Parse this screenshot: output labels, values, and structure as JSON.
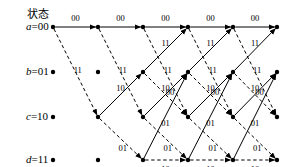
{
  "diagram": {
    "type": "convolutional-code-trellis",
    "title": "状态",
    "states": [
      {
        "id": "a",
        "name": "a",
        "eq": "=",
        "value": "00",
        "row": 0,
        "y": 27
      },
      {
        "id": "b",
        "name": "b",
        "eq": "=",
        "value": "01",
        "row": 1,
        "y": 72
      },
      {
        "id": "c",
        "name": "c",
        "eq": "=",
        "value": "10",
        "row": 2,
        "y": 117
      },
      {
        "id": "d",
        "name": "d",
        "eq": "=",
        "value": "11",
        "row": 3,
        "y": 160
      }
    ],
    "columns": [
      53,
      98,
      143,
      188,
      233,
      277
    ],
    "stage_count": 5,
    "colors": {
      "line": "#000000",
      "node": "#000000",
      "text": "#000000"
    },
    "legend": {
      "solid": "input 0",
      "dashed": "input 1"
    },
    "nodes": [
      {
        "col": 0,
        "row": 0
      },
      {
        "col": 0,
        "row": 1
      },
      {
        "col": 0,
        "row": 2
      },
      {
        "col": 0,
        "row": 3
      },
      {
        "col": 1,
        "row": 0
      },
      {
        "col": 1,
        "row": 1
      },
      {
        "col": 1,
        "row": 2
      },
      {
        "col": 1,
        "row": 3
      },
      {
        "col": 2,
        "row": 0
      },
      {
        "col": 2,
        "row": 1
      },
      {
        "col": 2,
        "row": 2
      },
      {
        "col": 2,
        "row": 3
      },
      {
        "col": 3,
        "row": 0
      },
      {
        "col": 3,
        "row": 1
      },
      {
        "col": 3,
        "row": 2
      },
      {
        "col": 3,
        "row": 3
      },
      {
        "col": 4,
        "row": 0
      },
      {
        "col": 4,
        "row": 1
      },
      {
        "col": 4,
        "row": 2
      },
      {
        "col": 4,
        "row": 3
      },
      {
        "col": 5,
        "row": 0
      },
      {
        "col": 5,
        "row": 1
      },
      {
        "col": 5,
        "row": 2
      },
      {
        "col": 5,
        "row": 3
      }
    ],
    "edges": [
      {
        "col": 0,
        "from": 0,
        "to": 0,
        "style": "solid",
        "label": "00",
        "lx": 0.5,
        "ly": -9
      },
      {
        "col": 0,
        "from": 0,
        "to": 2,
        "style": "dashed",
        "label": "11",
        "lx": 0.55,
        "ly": -7
      },
      {
        "col": 1,
        "from": 0,
        "to": 0,
        "style": "solid",
        "label": "00",
        "lx": 0.5,
        "ly": -9
      },
      {
        "col": 1,
        "from": 0,
        "to": 2,
        "style": "dashed",
        "label": "11",
        "lx": 0.55,
        "ly": -7
      },
      {
        "col": 1,
        "from": 2,
        "to": 1,
        "style": "solid",
        "label": "10",
        "lx": 0.5,
        "ly": -7
      },
      {
        "col": 1,
        "from": 2,
        "to": 3,
        "style": "dashed",
        "label": "01",
        "lx": 0.55,
        "ly": 7
      },
      {
        "col": 2,
        "from": 0,
        "to": 0,
        "style": "solid",
        "label": "00",
        "lx": 0.5,
        "ly": -9
      },
      {
        "col": 2,
        "from": 0,
        "to": 2,
        "style": "dashed",
        "label": "11",
        "lx": 0.55,
        "ly": -7
      },
      {
        "col": 2,
        "from": 1,
        "to": 0,
        "style": "solid",
        "label": "11",
        "lx": 0.5,
        "ly": -7
      },
      {
        "col": 2,
        "from": 1,
        "to": 2,
        "style": "dashed",
        "label": "00",
        "lx": 0.6,
        "ly": -7
      },
      {
        "col": 2,
        "from": 2,
        "to": 1,
        "style": "solid",
        "label": "10",
        "lx": 0.5,
        "ly": -7
      },
      {
        "col": 2,
        "from": 2,
        "to": 3,
        "style": "dashed",
        "label": "01",
        "lx": 0.55,
        "ly": 7
      },
      {
        "col": 2,
        "from": 3,
        "to": 1,
        "style": "solid",
        "label": "01",
        "lx": 0.5,
        "ly": 7
      },
      {
        "col": 2,
        "from": 3,
        "to": 3,
        "style": "dashed",
        "label": "10",
        "lx": 0.5,
        "ly": 9
      },
      {
        "col": 3,
        "from": 0,
        "to": 0,
        "style": "solid",
        "label": "00",
        "lx": 0.5,
        "ly": -9
      },
      {
        "col": 3,
        "from": 0,
        "to": 2,
        "style": "dashed",
        "label": "11",
        "lx": 0.55,
        "ly": -7
      },
      {
        "col": 3,
        "from": 1,
        "to": 0,
        "style": "solid",
        "label": "11",
        "lx": 0.5,
        "ly": -7
      },
      {
        "col": 3,
        "from": 1,
        "to": 2,
        "style": "dashed",
        "label": "00",
        "lx": 0.6,
        "ly": -7
      },
      {
        "col": 3,
        "from": 2,
        "to": 1,
        "style": "solid",
        "label": "10",
        "lx": 0.5,
        "ly": -7
      },
      {
        "col": 3,
        "from": 2,
        "to": 3,
        "style": "dashed",
        "label": "01",
        "lx": 0.55,
        "ly": 7
      },
      {
        "col": 3,
        "from": 3,
        "to": 1,
        "style": "solid",
        "label": "01",
        "lx": 0.5,
        "ly": 7
      },
      {
        "col": 3,
        "from": 3,
        "to": 3,
        "style": "dashed",
        "label": "10",
        "lx": 0.5,
        "ly": 9
      },
      {
        "col": 4,
        "from": 0,
        "to": 0,
        "style": "solid",
        "label": "00",
        "lx": 0.5,
        "ly": -9
      },
      {
        "col": 4,
        "from": 0,
        "to": 2,
        "style": "dashed",
        "label": "11",
        "lx": 0.55,
        "ly": -7
      },
      {
        "col": 4,
        "from": 1,
        "to": 0,
        "style": "solid",
        "label": "11",
        "lx": 0.5,
        "ly": -7
      },
      {
        "col": 4,
        "from": 1,
        "to": 2,
        "style": "dashed",
        "label": "00",
        "lx": 0.6,
        "ly": -7
      },
      {
        "col": 4,
        "from": 2,
        "to": 1,
        "style": "solid",
        "label": "10",
        "lx": 0.5,
        "ly": -7
      },
      {
        "col": 4,
        "from": 2,
        "to": 3,
        "style": "dashed",
        "label": "01",
        "lx": 0.55,
        "ly": 7
      },
      {
        "col": 4,
        "from": 3,
        "to": 1,
        "style": "solid",
        "label": "01",
        "lx": 0.5,
        "ly": 7
      },
      {
        "col": 4,
        "from": 3,
        "to": 3,
        "style": "dashed",
        "label": "10",
        "lx": 0.5,
        "ly": 9
      }
    ]
  }
}
